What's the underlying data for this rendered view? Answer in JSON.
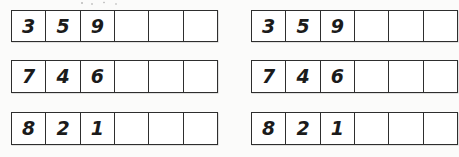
{
  "worksheet": {
    "background_color": "#fbfbfa",
    "cell_background_color": "#ffffff",
    "border_color": "#2e2e2e",
    "digit_color": "#1b1b1b",
    "columns_per_row": 6,
    "filled_columns_per_row": 3,
    "grids": [
      {
        "name": "left-grid",
        "rows": [
          {
            "name": "row-1",
            "cells": [
              "3",
              "5",
              "9",
              "",
              "",
              ""
            ]
          },
          {
            "name": "row-2",
            "cells": [
              "7",
              "4",
              "6",
              "",
              "",
              ""
            ]
          },
          {
            "name": "row-3",
            "cells": [
              "8",
              "2",
              "1",
              "",
              "",
              ""
            ]
          }
        ]
      },
      {
        "name": "right-grid",
        "rows": [
          {
            "name": "row-1",
            "cells": [
              "3",
              "5",
              "9",
              "",
              "",
              ""
            ]
          },
          {
            "name": "row-2",
            "cells": [
              "7",
              "4",
              "6",
              "",
              "",
              ""
            ]
          },
          {
            "name": "row-3",
            "cells": [
              "8",
              "2",
              "1",
              "",
              "",
              ""
            ]
          }
        ]
      }
    ]
  }
}
